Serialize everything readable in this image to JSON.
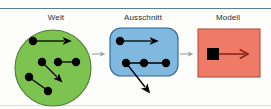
{
  "diagram": {
    "title_sequence": [
      "Welt",
      "Ausschnitt",
      "Modell"
    ],
    "stages": [
      {
        "id": "welt",
        "label": "Welt",
        "shape": "circle",
        "fill": "#7cc34f",
        "stroke": "#4f7a33",
        "node_count": 7,
        "nodes": [
          {
            "x": 33,
            "y": 41
          },
          {
            "x": 42,
            "y": 62
          },
          {
            "x": 58,
            "y": 62
          },
          {
            "x": 76,
            "y": 62
          },
          {
            "x": 29,
            "y": 77
          },
          {
            "x": 48,
            "y": 91
          },
          {
            "x": 56,
            "y": 75
          }
        ],
        "edges": [
          {
            "from": [
              33,
              41
            ],
            "to": [
              65,
              41
            ],
            "arrow": true
          },
          {
            "from": [
              58,
              62
            ],
            "to": [
              76,
              62
            ],
            "arrow": false
          },
          {
            "from": [
              42,
              62
            ],
            "to": [
              59,
              79
            ],
            "arrow": true
          },
          {
            "from": [
              29,
              77
            ],
            "to": [
              48,
              91
            ],
            "arrow": false
          }
        ]
      },
      {
        "id": "ausschnitt",
        "label": "Ausschnitt",
        "shape": "rounded-rectangle",
        "fill": "#7fb9e0",
        "stroke": "#2a6490",
        "node_count": 4,
        "nodes": [
          {
            "x": 120,
            "y": 41
          },
          {
            "x": 126,
            "y": 63
          },
          {
            "x": 144,
            "y": 63
          },
          {
            "x": 166,
            "y": 63
          }
        ],
        "edges": [
          {
            "from": [
              120,
              41
            ],
            "to": [
              152,
              41
            ],
            "arrow": true
          },
          {
            "from": [
              126,
              63
            ],
            "to": [
              166,
              63
            ],
            "arrow": false
          },
          {
            "from": [
              126,
              63
            ],
            "to": [
              148,
              90
            ],
            "arrow": true
          }
        ]
      },
      {
        "id": "modell",
        "label": "Modell",
        "shape": "rectangle",
        "fill": "#f07a68",
        "stroke": "#b35140",
        "node_count": 1,
        "nodes": [
          {
            "x": 213,
            "y": 54
          }
        ],
        "edges": [
          {
            "from": [
              219,
              54
            ],
            "to": [
              246,
              54
            ],
            "arrow": true
          }
        ],
        "arrow_color": "#8b2518"
      }
    ],
    "connectors": [
      {
        "from_stage": "welt",
        "to_stage": "ausschnitt",
        "glyph": "arrow-right",
        "color": "#9aa0a6"
      },
      {
        "from_stage": "ausschnitt",
        "to_stage": "modell",
        "glyph": "arrow-right",
        "color": "#9aa0a6"
      }
    ],
    "colors": {
      "welt_fill": "#7cc34f",
      "ausschnitt_fill": "#7fb9e0",
      "modell_fill": "#f07a68",
      "node": "#000000",
      "connector": "#9aa0a6",
      "rule": "#5b7c99",
      "background": "#fdfdfc"
    }
  }
}
